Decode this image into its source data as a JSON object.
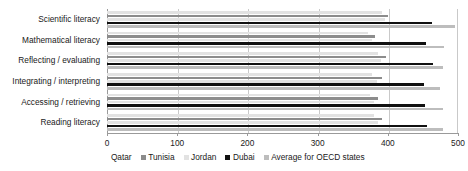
{
  "chart_data": {
    "type": "bar",
    "orientation": "horizontal",
    "title": "",
    "xlabel": "",
    "ylabel": "",
    "xlim": [
      0,
      500
    ],
    "xticks": [
      0,
      100,
      200,
      300,
      400,
      500
    ],
    "xtick_labels": [
      "0",
      "100",
      "200",
      "300",
      "400",
      "500"
    ],
    "grid": true,
    "legend_position": "bottom",
    "categories": [
      "Scientific literacy",
      "Mathematical literacy",
      "Reflecting / evaluating",
      "Integrating / interpreting",
      "Accessing / retrieving",
      "Reading literacy"
    ],
    "series": [
      {
        "name": "Qatar",
        "color": "#e2e2e2",
        "values": [
          392,
          372,
          386,
          378,
          375,
          380
        ]
      },
      {
        "name": "Tunisia",
        "color": "#8c8c8c",
        "values": [
          400,
          382,
          397,
          392,
          386,
          392
        ]
      },
      {
        "name": "Jordan",
        "color": "#e2e2e2",
        "values": [
          396,
          377,
          391,
          385,
          381,
          386
        ]
      },
      {
        "name": "Dubai",
        "color": "#111111",
        "values": [
          463,
          455,
          464,
          452,
          453,
          456
        ]
      },
      {
        "name": "Average for OECD states",
        "color": "#bdbdbd",
        "values": [
          496,
          480,
          479,
          474,
          479,
          479
        ]
      }
    ]
  },
  "legend": {
    "items": [
      {
        "label": "Qatar"
      },
      {
        "label": "Tunisia"
      },
      {
        "label": "Jordan"
      },
      {
        "label": "Dubai"
      },
      {
        "label": "Average for OECD states"
      }
    ]
  }
}
